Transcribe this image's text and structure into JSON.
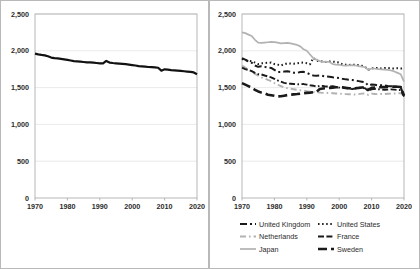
{
  "figure": {
    "panels": [
      "left-chart",
      "right-chart"
    ]
  },
  "chart_data": [
    {
      "id": "left",
      "type": "line",
      "title": "",
      "xlabel": "",
      "ylabel": "",
      "xlim": [
        1970,
        2020
      ],
      "ylim": [
        0,
        2500
      ],
      "xticks": [
        1970,
        1980,
        1990,
        2000,
        2010,
        2020
      ],
      "xtick_labels": [
        "1970",
        "1980",
        "1990",
        "2000",
        "2010",
        "2020"
      ],
      "yticks": [
        0,
        500,
        1000,
        1500,
        2000,
        2500
      ],
      "ytick_labels": [
        "0",
        "500",
        "1,000",
        "1,500",
        "2,000",
        "2,500"
      ],
      "grid": true,
      "legend": "none",
      "series": [
        {
          "name": "Average",
          "color": "#111111",
          "width": 2.2,
          "dash": "none",
          "x": [
            1970,
            1971,
            1972,
            1973,
            1974,
            1975,
            1976,
            1977,
            1978,
            1979,
            1980,
            1981,
            1982,
            1983,
            1984,
            1985,
            1986,
            1987,
            1988,
            1989,
            1990,
            1991,
            1992,
            1993,
            1994,
            1995,
            1996,
            1997,
            1998,
            1999,
            2000,
            2001,
            2002,
            2003,
            2004,
            2005,
            2006,
            2007,
            2008,
            2009,
            2010,
            2011,
            2012,
            2013,
            2014,
            2015,
            2016,
            2017,
            2018,
            2019,
            2020
          ],
          "values": [
            1962,
            1952,
            1944,
            1938,
            1925,
            1908,
            1900,
            1896,
            1890,
            1884,
            1876,
            1868,
            1860,
            1856,
            1852,
            1848,
            1844,
            1842,
            1838,
            1834,
            1830,
            1828,
            1862,
            1840,
            1834,
            1830,
            1826,
            1822,
            1818,
            1812,
            1806,
            1800,
            1792,
            1788,
            1784,
            1780,
            1778,
            1774,
            1770,
            1730,
            1748,
            1744,
            1738,
            1734,
            1730,
            1726,
            1722,
            1718,
            1714,
            1706,
            1682
          ]
        }
      ]
    },
    {
      "id": "right",
      "type": "line",
      "title": "",
      "xlabel": "",
      "ylabel": "",
      "xlim": [
        1970,
        2020
      ],
      "ylim": [
        0,
        2500
      ],
      "xticks": [
        1970,
        1980,
        1990,
        2000,
        2010,
        2020
      ],
      "xtick_labels": [
        "1970",
        "1980",
        "1990",
        "2000",
        "2010",
        "2020"
      ],
      "yticks": [
        0,
        500,
        1000,
        1500,
        2000,
        2500
      ],
      "ytick_labels": [
        "0",
        "500",
        "1,000",
        "1,500",
        "2,000",
        "2,500"
      ],
      "grid": true,
      "legend": "bottom",
      "x": [
        1970,
        1971,
        1972,
        1973,
        1974,
        1975,
        1976,
        1977,
        1978,
        1979,
        1980,
        1981,
        1982,
        1983,
        1984,
        1985,
        1986,
        1987,
        1988,
        1989,
        1990,
        1991,
        1992,
        1993,
        1994,
        1995,
        1996,
        1997,
        1998,
        1999,
        2000,
        2001,
        2002,
        2003,
        2004,
        2005,
        2006,
        2007,
        2008,
        2009,
        2010,
        2011,
        2012,
        2013,
        2014,
        2015,
        2016,
        2017,
        2018,
        2019,
        2020
      ],
      "series": [
        {
          "name": "United Kingdom",
          "color": "#1a1a1a",
          "width": 2.0,
          "dash": "7,3,2,3",
          "values": [
            1900,
            1880,
            1855,
            1838,
            1800,
            1782,
            1790,
            1782,
            1770,
            1768,
            1740,
            1712,
            1714,
            1718,
            1722,
            1716,
            1702,
            1700,
            1712,
            1714,
            1700,
            1680,
            1664,
            1662,
            1666,
            1658,
            1650,
            1648,
            1640,
            1636,
            1630,
            1620,
            1612,
            1608,
            1604,
            1596,
            1588,
            1580,
            1572,
            1528,
            1542,
            1538,
            1530,
            1532,
            1528,
            1522,
            1518,
            1514,
            1510,
            1504,
            1380
          ]
        },
        {
          "name": "United States",
          "color": "#1a1a1a",
          "width": 2.0,
          "dash": "1.5,2.6",
          "values": [
            1890,
            1872,
            1866,
            1856,
            1840,
            1820,
            1830,
            1834,
            1838,
            1840,
            1820,
            1812,
            1800,
            1816,
            1830,
            1826,
            1824,
            1830,
            1838,
            1840,
            1832,
            1818,
            1904,
            1866,
            1860,
            1852,
            1848,
            1854,
            1852,
            1848,
            1840,
            1816,
            1812,
            1808,
            1812,
            1808,
            1804,
            1796,
            1780,
            1742,
            1762,
            1764,
            1766,
            1760,
            1766,
            1768,
            1762,
            1760,
            1764,
            1758,
            1772
          ]
        },
        {
          "name": "Netherlands",
          "color": "#b2b2b2",
          "width": 1.9,
          "dash": "6,3,1.6,3",
          "values": [
            1800,
            1772,
            1744,
            1714,
            1686,
            1662,
            1640,
            1622,
            1604,
            1588,
            1562,
            1540,
            1520,
            1500,
            1492,
            1484,
            1478,
            1470,
            1464,
            1460,
            1452,
            1446,
            1440,
            1436,
            1432,
            1428,
            1430,
            1426,
            1424,
            1420,
            1418,
            1414,
            1412,
            1410,
            1408,
            1406,
            1412,
            1418,
            1420,
            1400,
            1418,
            1414,
            1410,
            1414,
            1412,
            1416,
            1418,
            1420,
            1422,
            1424,
            1390
          ]
        },
        {
          "name": "France",
          "color": "#1a1a1a",
          "width": 1.9,
          "dash": "6,2.4,6,2.4,1.6,2.4",
          "values": [
            1770,
            1752,
            1740,
            1724,
            1700,
            1682,
            1678,
            1664,
            1652,
            1640,
            1620,
            1598,
            1580,
            1564,
            1556,
            1552,
            1548,
            1544,
            1546,
            1548,
            1540,
            1532,
            1526,
            1512,
            1524,
            1522,
            1514,
            1516,
            1520,
            1508,
            1500,
            1496,
            1490,
            1486,
            1480,
            1488,
            1492,
            1496,
            1490,
            1452,
            1478,
            1482,
            1478,
            1474,
            1470,
            1472,
            1476,
            1472,
            1468,
            1466,
            1380
          ]
        },
        {
          "name": "Japan",
          "color": "#b2b2b2",
          "width": 1.7,
          "dash": "none",
          "values": [
            2250,
            2240,
            2220,
            2200,
            2150,
            2110,
            2108,
            2112,
            2116,
            2120,
            2118,
            2110,
            2100,
            2104,
            2108,
            2100,
            2090,
            2080,
            2060,
            2020,
            2000,
            1950,
            1900,
            1880,
            1860,
            1850,
            1852,
            1848,
            1820,
            1812,
            1810,
            1800,
            1798,
            1802,
            1806,
            1800,
            1792,
            1786,
            1776,
            1740,
            1760,
            1756,
            1752,
            1748,
            1744,
            1740,
            1732,
            1720,
            1700,
            1680,
            1580
          ]
        },
        {
          "name": "Sweden",
          "color": "#1a1a1a",
          "width": 2.6,
          "dash": "9,4",
          "values": [
            1560,
            1540,
            1520,
            1498,
            1470,
            1448,
            1432,
            1420,
            1404,
            1396,
            1388,
            1380,
            1382,
            1390,
            1398,
            1404,
            1408,
            1412,
            1418,
            1422,
            1428,
            1432,
            1438,
            1444,
            1480,
            1488,
            1492,
            1496,
            1500,
            1504,
            1506,
            1504,
            1498,
            1492,
            1488,
            1492,
            1496,
            1502,
            1508,
            1470,
            1496,
            1500,
            1504,
            1508,
            1506,
            1510,
            1512,
            1514,
            1512,
            1508,
            1392
          ]
        }
      ],
      "legend_items": [
        {
          "label": "United Kingdom",
          "color": "#1a1a1a",
          "width": 2.0,
          "dash": "7,3,2,3"
        },
        {
          "label": "United States",
          "color": "#1a1a1a",
          "width": 2.0,
          "dash": "1.5,2.6"
        },
        {
          "label": "Netherlands",
          "color": "#b2b2b2",
          "width": 1.9,
          "dash": "6,3,1.6,3"
        },
        {
          "label": "France",
          "color": "#1a1a1a",
          "width": 1.9,
          "dash": "6,2.4,6,2.4,1.6,2.4"
        },
        {
          "label": "Japan",
          "color": "#b2b2b2",
          "width": 1.7,
          "dash": "none"
        },
        {
          "label": "Sweden",
          "color": "#1a1a1a",
          "width": 2.6,
          "dash": "9,4"
        }
      ]
    }
  ]
}
